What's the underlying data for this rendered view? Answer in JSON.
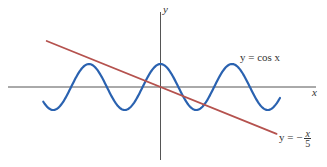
{
  "chart_data": {
    "type": "line",
    "title": "",
    "xlabel": "x",
    "ylabel": "y",
    "grid": false,
    "legend": "inline annotations",
    "xlim": [
      -6.6,
      13.7
    ],
    "ylim": [
      -3.2,
      3.3
    ],
    "series": [
      {
        "name": "y = cos x",
        "color": "#2a62b0",
        "function": "cos(x)",
        "x_range": [
          -10.3,
          10.5
        ],
        "label": "y = cos x"
      },
      {
        "name": "y = -x/5",
        "color": "#b5524e",
        "function": "-x/5",
        "x_range": [
          -10.0,
          10.2
        ],
        "label_prefix": "y = −",
        "label_num": "x",
        "label_den": "5"
      }
    ],
    "axes": {
      "x_label": "x",
      "y_label": "y",
      "color": "#555555"
    }
  },
  "labels": {
    "y_axis": "y",
    "x_axis": "x",
    "cos_label": "y = cos x",
    "line_label_prefix": "y = −",
    "line_label_num": "x",
    "line_label_den": "5"
  }
}
